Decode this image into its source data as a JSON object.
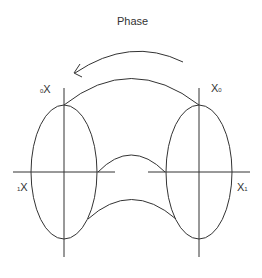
{
  "title": "Phase",
  "labels": {
    "top_left": {
      "main": "X",
      "sub": "0"
    },
    "top_right": {
      "main": "X",
      "sub": "0"
    },
    "mid_left": {
      "main": "X",
      "sub": "1"
    },
    "mid_right": {
      "main": "X",
      "sub": "1"
    }
  },
  "colors": {
    "stroke": "#333333",
    "background": "#ffffff"
  }
}
